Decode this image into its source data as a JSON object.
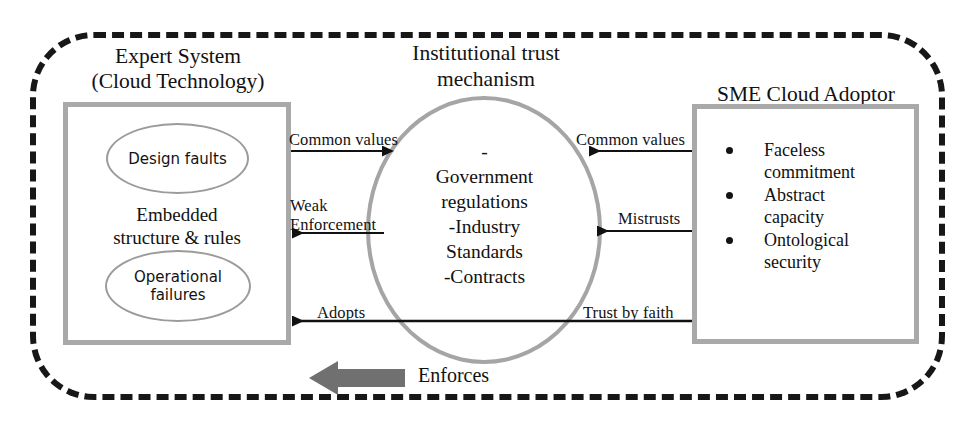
{
  "diagram": {
    "title_absent": true,
    "outer_boundary": {
      "name": "institutional-environment-boundary",
      "style": "dashed rounded rectangle",
      "color": "#171717"
    },
    "left_entity": {
      "caption": "Expert System\n(Cloud Technology)",
      "ellipse_top": "Design faults",
      "middle_text": "Embedded\nstructure & rules",
      "ellipse_bottom": "Operational\nfailures",
      "border_color": "#a9a9a9"
    },
    "center_entity": {
      "caption": "Institutional trust\nmechanism",
      "body": "-\nGovernment\nregulations\n-Industry\nStandards\n-Contracts",
      "border_color": "#a5a5a5"
    },
    "right_entity": {
      "caption": "SME Cloud Adoptor",
      "bullets": [
        "Faceless\ncommitment",
        "Abstract\ncapacity",
        "Ontological\nsecurity"
      ],
      "border_color": "#a9a9a9"
    },
    "arrows": [
      {
        "id": "common-values-left",
        "label": "Common values",
        "direction": "right",
        "from": "Expert System",
        "to": "Institutional trust mechanism"
      },
      {
        "id": "common-values-right",
        "label": "Common values",
        "direction": "left",
        "from": "SME Cloud Adoptor",
        "to": "Institutional trust mechanism"
      },
      {
        "id": "weak-enforcement",
        "label": "Weak\nEnforcement",
        "direction": "left",
        "from": "Institutional trust mechanism",
        "to": "Expert System"
      },
      {
        "id": "mistrusts",
        "label": "Mistrusts",
        "direction": "left",
        "from": "SME Cloud Adoptor",
        "to": "Institutional trust mechanism"
      },
      {
        "id": "adopts",
        "label": "Adopts",
        "direction": "left",
        "from": "SME Cloud Adoptor",
        "to": "Expert System"
      },
      {
        "id": "trust-by-faith",
        "label": "Trust by faith",
        "direction": "left",
        "from": "SME Cloud Adoptor",
        "to": "Expert System"
      },
      {
        "id": "enforces",
        "label": "Enforces",
        "direction": "left",
        "style": "thick block arrow",
        "color": "#6b6b6b"
      }
    ]
  }
}
